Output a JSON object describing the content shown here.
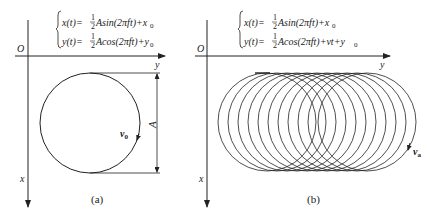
{
  "figure": {
    "panels": [
      {
        "id": "a",
        "caption": "(a)",
        "origin_label": "O",
        "x_axis_label": "x",
        "y_axis_label": "y",
        "equations": {
          "line1": {
            "lhs": "x(t)=",
            "frac_num": "1",
            "frac_den": "2",
            "rhs": "Asin(2πft)+x",
            "sub": "0"
          },
          "line2": {
            "lhs": "y(t)=",
            "frac_num": "1",
            "frac_den": "2",
            "rhs": "Acos(2πft)+y",
            "sub": "0"
          }
        },
        "dimension_label": "A",
        "velocity_label": "v",
        "velocity_sub": "0"
      },
      {
        "id": "b",
        "caption": "(b)",
        "origin_label": "O",
        "x_axis_label": "x",
        "y_axis_label": "y",
        "equations": {
          "line1": {
            "lhs": "x(t)=",
            "frac_num": "1",
            "frac_den": "2",
            "rhs": "Asin(2πft)+x",
            "sub": "0"
          },
          "line2": {
            "lhs": "y(t)=",
            "frac_num": "1",
            "frac_den": "2",
            "rhs": "Acos(2πft)+vt+y",
            "sub": "0"
          }
        },
        "velocity_label": "v",
        "velocity_sub": "a",
        "circle_count": 11
      }
    ],
    "colors": {
      "stroke": "#222222",
      "background": "#ffffff"
    }
  }
}
